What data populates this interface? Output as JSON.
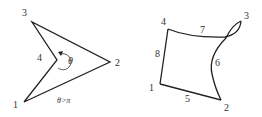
{
  "figures": [
    {
      "id": "left",
      "description": "Concave quadrilateral with reflex interior angle",
      "nodes": [
        {
          "label": "1",
          "x": 24,
          "y": 102
        },
        {
          "label": "2",
          "x": 110,
          "y": 62
        },
        {
          "label": "3",
          "x": 32,
          "y": 22
        },
        {
          "label": "4",
          "x": 57,
          "y": 60
        }
      ],
      "angle_label": "θ",
      "condition_label": "θ>π"
    },
    {
      "id": "right",
      "description": "Distorted 8-node quadrilateral element with curved edges",
      "corner_nodes": [
        {
          "label": "1",
          "x": 160,
          "y": 84
        },
        {
          "label": "2",
          "x": 221,
          "y": 100
        },
        {
          "label": "3",
          "x": 241,
          "y": 21
        },
        {
          "label": "4",
          "x": 168,
          "y": 29
        }
      ],
      "midside_nodes": [
        {
          "label": "5"
        },
        {
          "label": "6"
        },
        {
          "label": "7"
        },
        {
          "label": "8"
        }
      ]
    }
  ],
  "colors": {
    "line": "#222222",
    "text": "#333333"
  }
}
